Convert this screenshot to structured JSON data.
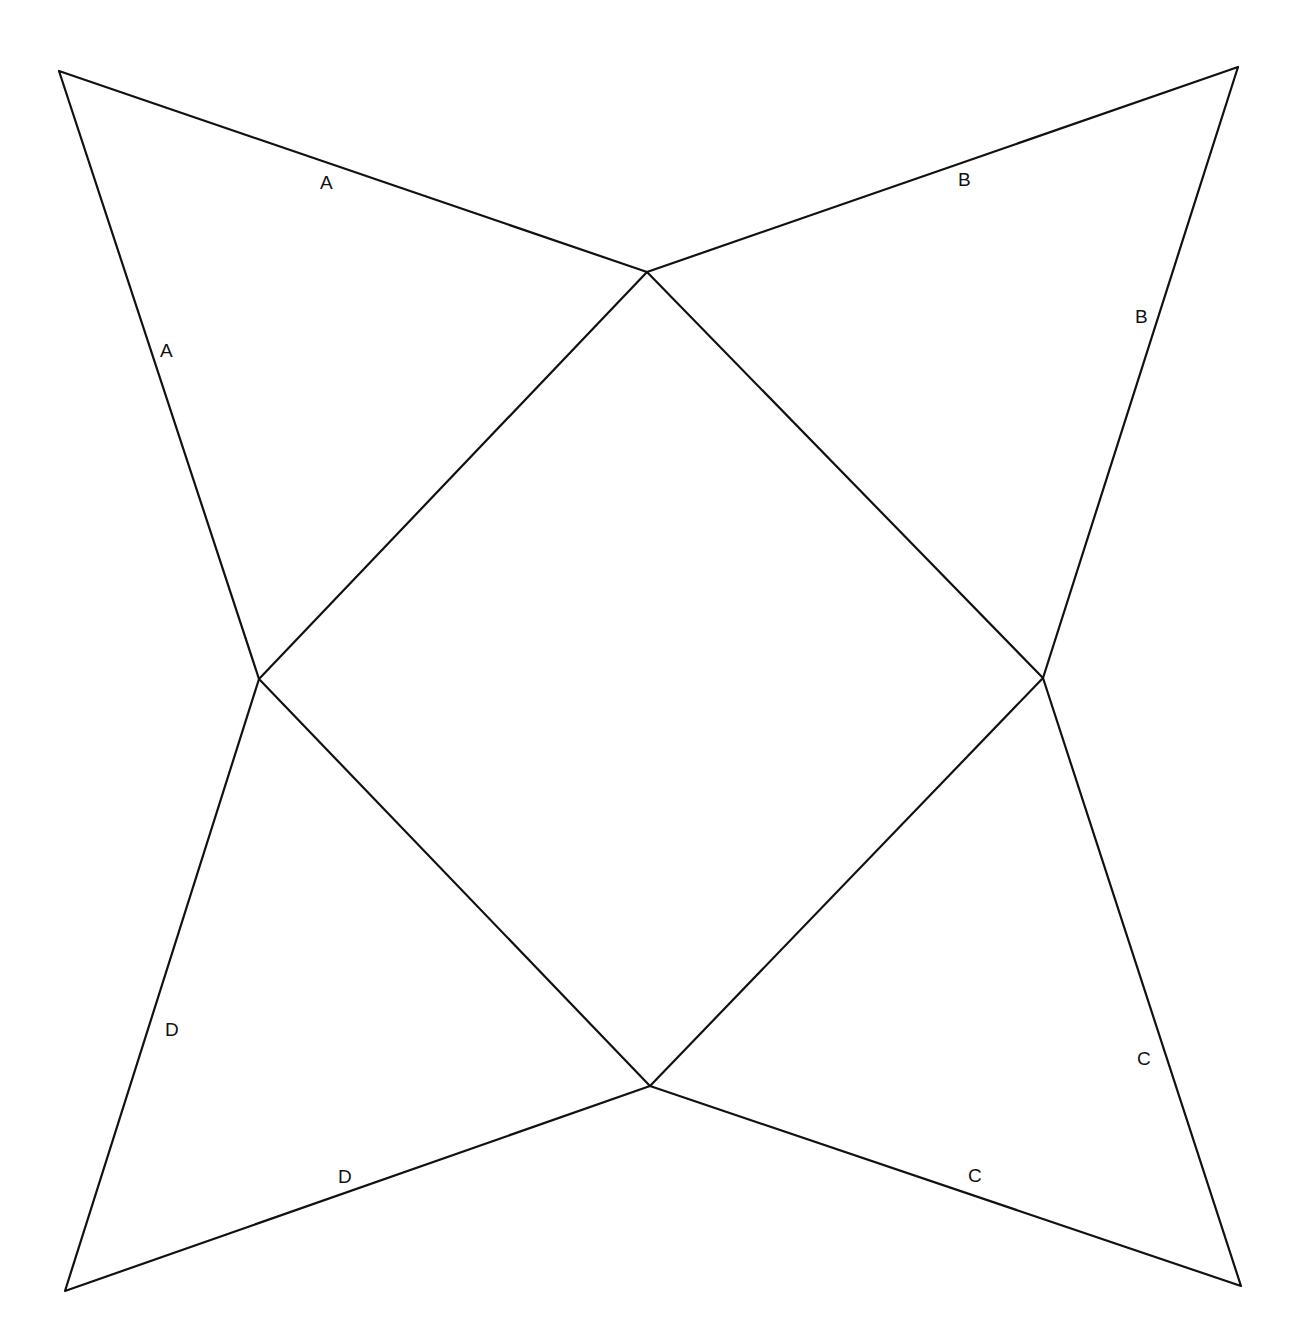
{
  "diagram": {
    "type": "square pyramid net",
    "stroke_color": "#111111",
    "background": "#ffffff",
    "vertices": {
      "top": [
        647,
        272
      ],
      "left": [
        259,
        679
      ],
      "right": [
        1043,
        678
      ],
      "bottom": [
        650,
        1086
      ],
      "tl_tip": [
        59,
        71
      ],
      "tr_tip": [
        1238,
        67
      ],
      "bl_tip": [
        65,
        1291
      ],
      "br_tip": [
        1241,
        1286
      ]
    },
    "labels": [
      {
        "text": "A",
        "x": 320,
        "y": 189
      },
      {
        "text": "A",
        "x": 160,
        "y": 357
      },
      {
        "text": "B",
        "x": 958,
        "y": 186
      },
      {
        "text": "B",
        "x": 1135,
        "y": 323
      },
      {
        "text": "C",
        "x": 1137,
        "y": 1065
      },
      {
        "text": "C",
        "x": 968,
        "y": 1182
      },
      {
        "text": "D",
        "x": 165,
        "y": 1036
      },
      {
        "text": "D",
        "x": 338,
        "y": 1183
      }
    ]
  }
}
